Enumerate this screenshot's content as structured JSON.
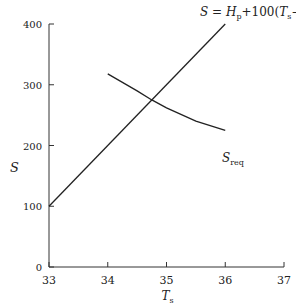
{
  "chart_data": {
    "type": "line",
    "title": "",
    "xlabel": "T_s",
    "ylabel": "S",
    "xlim": [
      33,
      37
    ],
    "ylim": [
      0,
      400
    ],
    "xticks": [
      "33",
      "34",
      "35",
      "36",
      "37"
    ],
    "yticks": [
      "0",
      "100",
      "200",
      "300",
      "400"
    ],
    "grid": false,
    "series": [
      {
        "name": "S = H_p + 100(T_s − 34.0)",
        "x": [
          33,
          36
        ],
        "y": [
          100,
          400
        ]
      },
      {
        "name": "S_req",
        "x": [
          34.0,
          34.5,
          34.75,
          35.0,
          35.5,
          36.0
        ],
        "y": [
          318,
          290,
          275,
          262,
          240,
          225
        ]
      }
    ],
    "annotations": [
      "S = H_p + 100(T_s − 34.0)",
      "S_req"
    ]
  },
  "labels": {
    "equation_prefix": "S = H",
    "equation_sub": "p",
    "equation_suffix": " + 100(T",
    "equation_sub2": "s",
    "equation_end": " − 34.0)",
    "sreq": "S",
    "sreq_sub": "req",
    "ylabel": "S",
    "xlabel": "T",
    "xlabel_sub": "s"
  }
}
